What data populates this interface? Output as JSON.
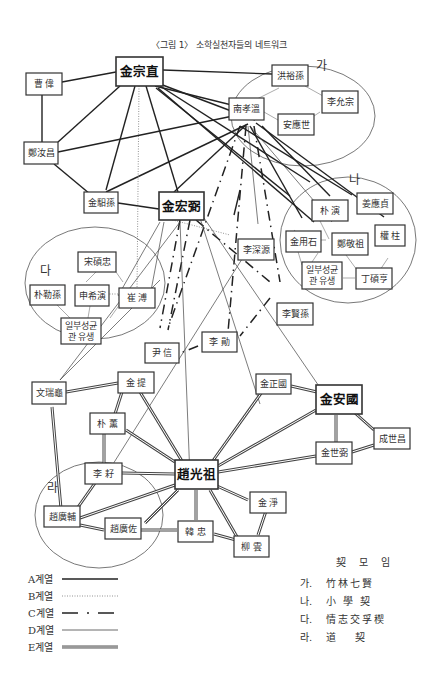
{
  "title": "〈그림 1〉 소학실천자들의 네트워크",
  "nodes": {
    "kim_jongjik": "金宗直",
    "jo_wi": "曹 偉",
    "jeong_yeochang": "鄭汝昌",
    "kim_ilson": "金馹孫",
    "kim_goengpil": "金宏弼",
    "hong_yuson": "洪裕孫",
    "nam_hyoon": "南孝溫",
    "yi_yunjong": "李允宗",
    "an_eungse": "安應世",
    "bak_yeon": "朴 演",
    "kang_eungjeong": "姜應貞",
    "kim_yongseok": "金用石",
    "jeong_gyeongjo": "鄭敬祖",
    "gwon_ju": "權 柱",
    "ilbu_na": [
      "일부성균",
      "관 유생"
    ],
    "jeong_seokhyeong": "丁碩亨",
    "song_seokchung": "宋碩忠",
    "bak_reukson": "朴勒孫",
    "shin_huiyeon": "申希演",
    "choe_bu": "崔 溥",
    "ilbu_da": [
      "일부성균",
      "관 유생"
    ],
    "yi_simwon": "李深源",
    "yi_hyeonson": "李賢孫",
    "yun_sin": "尹 信",
    "yi_hun": "李 勛",
    "mun_seogwi": "文瑞龜",
    "kim_je": "金 提",
    "bak_hun": "朴 薰",
    "kim_jeongguk": "金正國",
    "kim_anguk": "金安國",
    "seong_sechang": "成世昌",
    "kim_sepil": "金世弼",
    "yi_ja": "李 耔",
    "jo_gwangjo": "趙光祖",
    "kim_jeong": "金 淨",
    "jo_gwangbo": "趙廣輔",
    "jo_gwangjwa": "趙廣佐",
    "han_chung": "韓 忠",
    "yu_un": "柳 雲"
  },
  "groups": {
    "ga": "가",
    "na": "나",
    "da": "다",
    "ra": "라"
  },
  "legend": [
    {
      "label": "A계열",
      "style": "solid-thick"
    },
    {
      "label": "B계열",
      "style": "dotted"
    },
    {
      "label": "C계열",
      "style": "dash-dot"
    },
    {
      "label": "D계열",
      "style": "solid-thin"
    },
    {
      "label": "E계열",
      "style": "double"
    }
  ],
  "kye": {
    "title": "契 모 임",
    "items": [
      {
        "key": "가.",
        "name": "竹林七賢"
      },
      {
        "key": "나.",
        "name": "小 學 契"
      },
      {
        "key": "다.",
        "name": "情志交孚稧"
      },
      {
        "key": "라.",
        "name": "道　 契"
      }
    ]
  }
}
